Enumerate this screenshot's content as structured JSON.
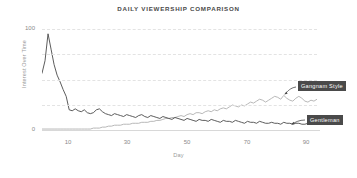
{
  "chart_data": {
    "type": "line",
    "title": "DAILY VIEWERSHIP COMPARISON",
    "xlabel": "Day",
    "ylabel": "Interest Over Time",
    "xlim": [
      1,
      92
    ],
    "ylim": [
      0,
      105
    ],
    "grid": true,
    "gridlines_y": [
      0,
      25,
      50,
      75,
      100
    ],
    "xticks": [
      10,
      30,
      50,
      70,
      90
    ],
    "xticklabels": [
      "10",
      "30",
      "50",
      "70",
      "90"
    ],
    "yticks": [
      0,
      100
    ],
    "yticklabels": [
      "0",
      "100"
    ],
    "legend": "annotations",
    "annotations": [
      {
        "text": "Gangnam Style",
        "points_to_series": "Gangnam Style",
        "points_to_x": 80,
        "points_to_y": 32
      },
      {
        "text": "Gentleman",
        "points_to_series": "Gentleman",
        "points_to_x": 80,
        "points_to_y": 5
      }
    ],
    "x": [
      1,
      2,
      3,
      4,
      5,
      6,
      7,
      8,
      9,
      10,
      11,
      12,
      13,
      14,
      15,
      16,
      17,
      18,
      19,
      20,
      21,
      22,
      23,
      24,
      25,
      26,
      27,
      28,
      29,
      30,
      31,
      32,
      33,
      34,
      35,
      36,
      37,
      38,
      39,
      40,
      41,
      42,
      43,
      44,
      45,
      46,
      47,
      48,
      49,
      50,
      51,
      52,
      53,
      54,
      55,
      56,
      57,
      58,
      59,
      60,
      61,
      62,
      63,
      64,
      65,
      66,
      67,
      68,
      69,
      70,
      71,
      72,
      73,
      74,
      75,
      76,
      77,
      78,
      79,
      80,
      81,
      82,
      83,
      84,
      85,
      86,
      87,
      88,
      89,
      90,
      91,
      92
    ],
    "series": [
      {
        "name": "Gangnam Style",
        "color": "#4a4a4a",
        "values": [
          59,
          72,
          100,
          84,
          68,
          57,
          50,
          42,
          35,
          21,
          20,
          22,
          20,
          19,
          21,
          18,
          17,
          18,
          21,
          22,
          19,
          17,
          16,
          15,
          17,
          16,
          15,
          14,
          16,
          15,
          14,
          13,
          15,
          16,
          14,
          13,
          15,
          14,
          13,
          12,
          14,
          13,
          12,
          11,
          13,
          12,
          11,
          10,
          12,
          11,
          10,
          9,
          11,
          10,
          10,
          9,
          11,
          10,
          9,
          8,
          10,
          9,
          9,
          8,
          10,
          9,
          8,
          7,
          9,
          8,
          8,
          7,
          9,
          8,
          7,
          7,
          8,
          7,
          7,
          6,
          8,
          7,
          7,
          6,
          7,
          7,
          6,
          6,
          7,
          6,
          6,
          7
        ]
      },
      {
        "name": "Gentleman",
        "color": "#b0b0b0",
        "values": [
          1,
          1,
          1,
          1,
          1,
          1,
          1,
          1,
          1,
          1,
          1,
          1,
          1,
          1,
          1,
          1,
          1,
          2,
          2,
          2,
          3,
          3,
          4,
          4,
          5,
          5,
          5,
          6,
          6,
          6,
          7,
          7,
          7,
          8,
          8,
          8,
          9,
          9,
          10,
          10,
          11,
          12,
          12,
          13,
          13,
          14,
          15,
          14,
          16,
          17,
          16,
          18,
          18,
          17,
          19,
          20,
          19,
          21,
          20,
          22,
          23,
          22,
          24,
          26,
          25,
          24,
          26,
          25,
          27,
          29,
          28,
          30,
          32,
          31,
          29,
          31,
          33,
          35,
          34,
          32,
          36,
          33,
          31,
          30,
          33,
          35,
          33,
          30,
          29,
          31,
          30,
          32
        ]
      }
    ]
  }
}
